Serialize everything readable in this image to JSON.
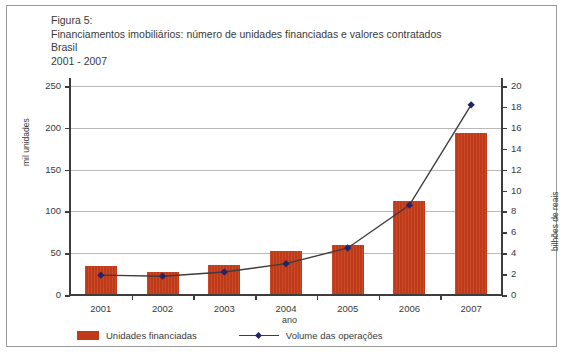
{
  "figure": {
    "label": "Figura 5:",
    "title": "Financiamentos imobiliários: número de unidades financiadas e valores contratados",
    "region": "Brasil",
    "period": "2001 - 2007"
  },
  "colors": {
    "bar": "#c13a18",
    "line": "#3d3d3d",
    "marker": "#23246b",
    "grid": "#b9b9b9",
    "axis": "#3d3d3d",
    "frame": "#9a9a9a"
  },
  "legend": {
    "bar_label": "Unidades financiadas",
    "line_label": "Volume das operações"
  },
  "chart_data": {
    "type": "bar",
    "title": "Financiamentos imobiliários: número de unidades financiadas e valores contratados",
    "subtitle": "Brasil 2001 - 2007",
    "categories": [
      "2001",
      "2002",
      "2003",
      "2004",
      "2005",
      "2006",
      "2007"
    ],
    "xlabel": "ano",
    "ylabel": "mil unidades",
    "ylabel_secondary": "bilhões de reais",
    "ylim": [
      0,
      250
    ],
    "ylim_secondary": [
      0,
      20
    ],
    "yticks": [
      0,
      50,
      100,
      150,
      200,
      250
    ],
    "yticks_secondary": [
      0,
      2,
      4,
      6,
      8,
      10,
      12,
      14,
      16,
      18,
      20
    ],
    "grid": true,
    "legend_position": "bottom",
    "series": [
      {
        "name": "Unidades financiadas",
        "type": "bar",
        "axis": "left",
        "unit": "mil unidades",
        "values": [
          35,
          28,
          36,
          53,
          60,
          112,
          194
        ]
      },
      {
        "name": "Volume das operações",
        "type": "line",
        "axis": "right",
        "unit": "bilhões de reais",
        "values": [
          1.9,
          1.8,
          2.2,
          3.0,
          4.5,
          8.6,
          18.2
        ]
      }
    ]
  }
}
